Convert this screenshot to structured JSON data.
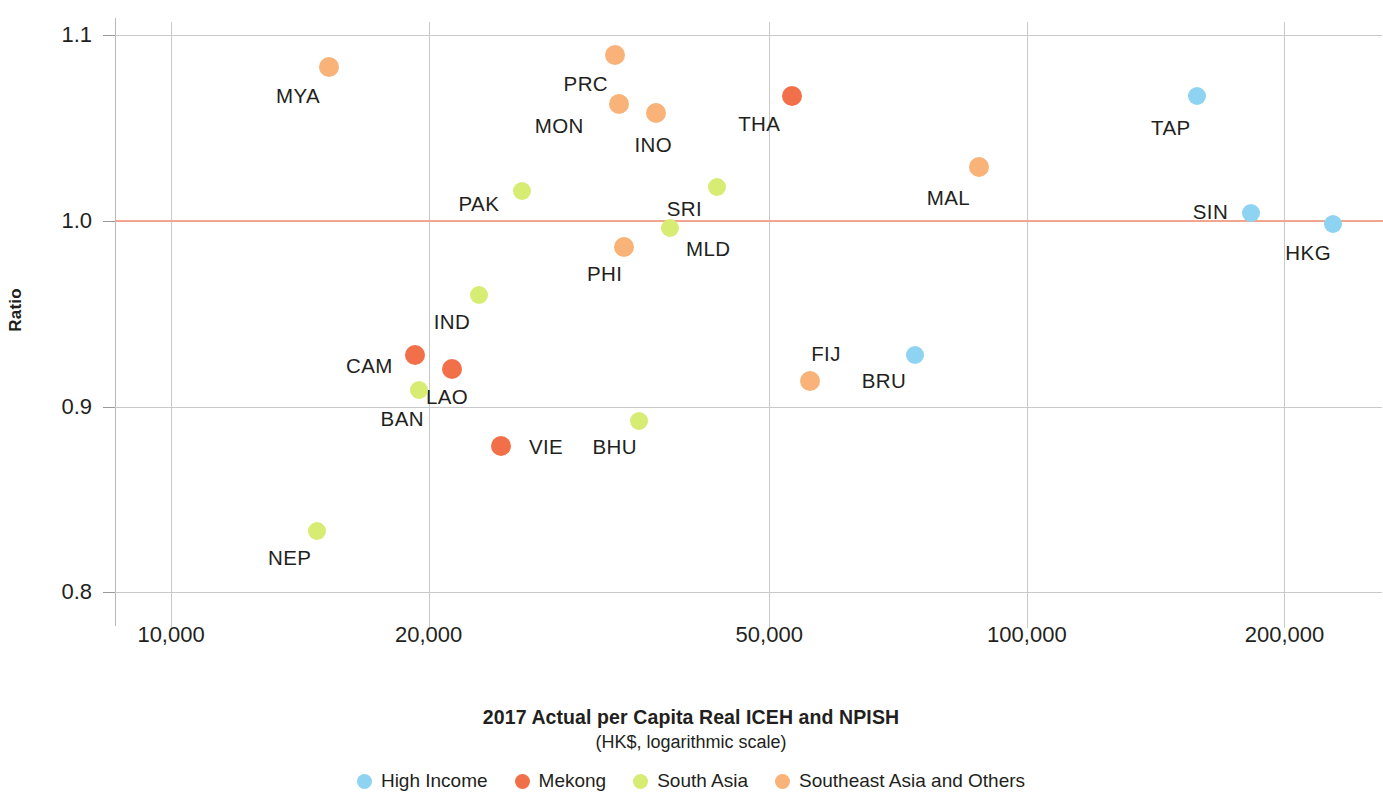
{
  "chart_data": {
    "type": "scatter",
    "title": "",
    "xlabel": "2017 Actual per Capita Real ICEH and NPISH",
    "xlabel_sub": "(HK$, logarithmic scale)",
    "ylabel": "Ratio",
    "xscale": "log",
    "xlim": [
      8600,
      260000
    ],
    "ylim": [
      0.784,
      1.107
    ],
    "xticks": [
      "10,000",
      "20,000",
      "50,000",
      "100,000",
      "200,000"
    ],
    "xtick_values": [
      10000,
      20000,
      50000,
      100000,
      200000
    ],
    "yticks": [
      "0.8",
      "0.9",
      "1.0",
      "1.1"
    ],
    "ytick_values": [
      0.8,
      0.9,
      1.0,
      1.1
    ],
    "grid": true,
    "reference_line": {
      "y": 1.0,
      "color": "#f3a28a"
    },
    "legend_position": "bottom",
    "series": [
      {
        "name": "High Income",
        "color": "#8ed4f2"
      },
      {
        "name": "Mekong",
        "color": "#f1704a"
      },
      {
        "name": "South Asia",
        "color": "#d7ec72"
      },
      {
        "name": "Southeast Asia and Others",
        "color": "#f9b277"
      }
    ],
    "points": [
      {
        "label": "MYA",
        "group": "Southeast Asia and Others",
        "x": 15300,
        "y": 1.083,
        "lx": -31,
        "ly": 29
      },
      {
        "label": "PRC",
        "group": "Southeast Asia and Others",
        "x": 33000,
        "y": 1.089,
        "lx": -29,
        "ly": 29
      },
      {
        "label": "MON",
        "group": "Southeast Asia and Others",
        "x": 33400,
        "y": 1.063,
        "lx": -60,
        "ly": 22
      },
      {
        "label": "INO",
        "group": "Southeast Asia and Others",
        "x": 36900,
        "y": 1.058,
        "lx": -3,
        "ly": 32
      },
      {
        "label": "THA",
        "group": "Mekong",
        "x": 53200,
        "y": 1.067,
        "lx": -33,
        "ly": 28
      },
      {
        "label": "TAP",
        "group": "High Income",
        "x": 158000,
        "y": 1.067,
        "lx": -26,
        "ly": 32
      },
      {
        "label": "MAL",
        "group": "Southeast Asia and Others",
        "x": 88000,
        "y": 1.029,
        "lx": -31,
        "ly": 31
      },
      {
        "label": "SRI",
        "group": "South Asia",
        "x": 43500,
        "y": 1.018,
        "lx": -33,
        "ly": 22
      },
      {
        "label": "PAK",
        "group": "South Asia",
        "x": 25700,
        "y": 1.016,
        "lx": -43,
        "ly": 13
      },
      {
        "label": "SIN",
        "group": "High Income",
        "x": 183000,
        "y": 1.004,
        "lx": -41,
        "ly": -1
      },
      {
        "label": "HKG",
        "group": "High Income",
        "x": 228000,
        "y": 0.998,
        "lx": -25,
        "ly": 29
      },
      {
        "label": "MLD",
        "group": "South Asia",
        "x": 38300,
        "y": 0.996,
        "lx": 38,
        "ly": 21
      },
      {
        "label": "PHI",
        "group": "Southeast Asia and Others",
        "x": 33800,
        "y": 0.986,
        "lx": -19,
        "ly": 27
      },
      {
        "label": "IND",
        "group": "South Asia",
        "x": 22900,
        "y": 0.96,
        "lx": -27,
        "ly": 27
      },
      {
        "label": "CAM",
        "group": "Mekong",
        "x": 19300,
        "y": 0.928,
        "lx": -46,
        "ly": 11
      },
      {
        "label": "LAO",
        "group": "Mekong",
        "x": 21300,
        "y": 0.92,
        "lx": -5,
        "ly": 28
      },
      {
        "label": "BAN",
        "group": "South Asia",
        "x": 19500,
        "y": 0.909,
        "lx": -17,
        "ly": 29
      },
      {
        "label": "BHU",
        "group": "South Asia",
        "x": 35200,
        "y": 0.892,
        "lx": -24,
        "ly": 26
      },
      {
        "label": "VIE",
        "group": "Mekong",
        "x": 24300,
        "y": 0.879,
        "lx": 45,
        "ly": 1
      },
      {
        "label": "FIJ",
        "group": "Southeast Asia and Others",
        "x": 55800,
        "y": 0.914,
        "lx": 16,
        "ly": -27
      },
      {
        "label": "BRU",
        "group": "High Income",
        "x": 74000,
        "y": 0.928,
        "lx": -31,
        "ly": 26
      },
      {
        "label": "NEP",
        "group": "South Asia",
        "x": 14800,
        "y": 0.833,
        "lx": -27,
        "ly": 27
      }
    ]
  }
}
